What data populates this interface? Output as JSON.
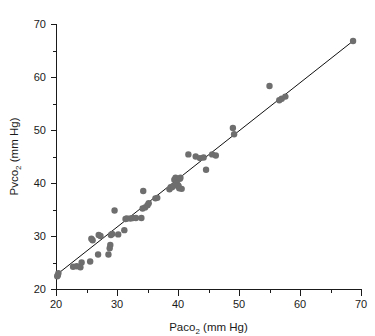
{
  "chart_data": {
    "type": "scatter",
    "title": "",
    "xlabel": "Paco2 (mm Hg)",
    "xlabel_base": "Paco",
    "xlabel_sub": "2",
    "xlabel_unit": " (mm Hg)",
    "ylabel": "Pvco2 (mm Hg)",
    "ylabel_base": "Pvco",
    "ylabel_sub": "2",
    "ylabel_unit": " (mm Hg)",
    "xlim": [
      20,
      70
    ],
    "ylim": [
      20,
      70
    ],
    "x_major_ticks": [
      20,
      30,
      40,
      50,
      60,
      70
    ],
    "x_minor_ticks": [
      25,
      35,
      45,
      55,
      65
    ],
    "y_major_ticks": [
      20,
      30,
      40,
      50,
      60,
      70
    ],
    "y_minor_ticks": [
      25,
      35,
      45,
      55,
      65
    ],
    "x_tick_labels": [
      "20",
      "30",
      "40",
      "50",
      "60",
      "70"
    ],
    "y_tick_labels": [
      "20",
      "30",
      "40",
      "50",
      "60",
      "70"
    ],
    "grid": false,
    "legend": "none",
    "point_color": "#6e6e6e",
    "point_radius_px": 3.2,
    "line_color": "#101010",
    "axis_color": "#1a1a1a",
    "background_color": "#ffffff",
    "fit_line": {
      "label": "line of identity",
      "x_start": 20.0,
      "y_start": 22.6,
      "x_end": 68.7,
      "y_end": 66.8
    },
    "x": [
      20.2,
      20.3,
      20.4,
      22.8,
      23.4,
      24.0,
      24.2,
      25.6,
      25.8,
      26.0,
      26.9,
      27.0,
      27.3,
      28.6,
      28.8,
      28.9,
      29.0,
      29.2,
      29.6,
      30.2,
      31.2,
      31.4,
      31.6,
      32.2,
      32.6,
      33.1,
      34.0,
      34.2,
      34.3,
      34.6,
      35.0,
      35.2,
      36.3,
      36.6,
      38.6,
      38.8,
      39.0,
      39.2,
      39.4,
      39.6,
      39.8,
      40.0,
      40.1,
      40.2,
      40.3,
      40.4,
      40.6,
      41.7,
      42.9,
      43.6,
      44.2,
      44.6,
      45.6,
      46.2,
      49.0,
      49.2,
      55.0,
      56.6,
      57.0,
      57.6,
      68.7
    ],
    "y": [
      22.4,
      22.6,
      23.0,
      24.2,
      24.3,
      24.1,
      25.0,
      25.2,
      29.5,
      29.2,
      26.5,
      30.2,
      30.0,
      26.5,
      27.7,
      28.3,
      30.2,
      30.4,
      34.8,
      30.3,
      31.1,
      33.2,
      33.3,
      33.3,
      33.4,
      33.4,
      33.4,
      35.2,
      38.5,
      35.4,
      35.8,
      36.2,
      37.1,
      37.2,
      38.8,
      39.2,
      39.2,
      39.4,
      40.6,
      41.0,
      40.0,
      39.6,
      39.4,
      39.0,
      40.8,
      41.0,
      38.9,
      45.4,
      45.0,
      44.7,
      44.8,
      42.5,
      45.4,
      45.2,
      50.4,
      49.2,
      58.3,
      55.6,
      55.9,
      56.3,
      66.8
    ]
  }
}
